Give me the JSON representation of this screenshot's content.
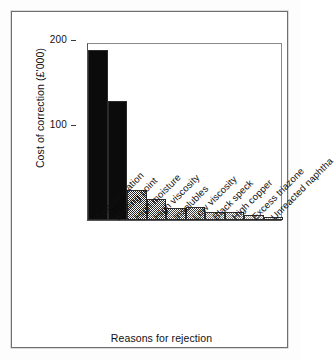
{
  "chart_data": {
    "type": "bar",
    "title": "",
    "xlabel": "Reasons for rejection",
    "ylabel": "Cost of correction (£'000)",
    "ylim": [
      0,
      210
    ],
    "yticks": [
      100,
      200
    ],
    "ytick_labels": [
      "100",
      "200"
    ],
    "grid": false,
    "legend": false,
    "categories": [
      "Contamination",
      "Melting point",
      "High moisture",
      "High viscosity",
      "Insolubles",
      "Low viscosity",
      "Black speck",
      "High copper",
      "Excess triazone",
      "Unreacted naphtha"
    ],
    "values": [
      200,
      141,
      36,
      25,
      14,
      15,
      9,
      9,
      6,
      3
    ],
    "bar_shades": [
      "#0b0b0b",
      "#0b0b0b",
      "#222222",
      "#2c2c2c",
      "#3c3c3c",
      "#3c3c3c",
      "#6e6e6e",
      "#6e6e6e",
      "#9a9a9a",
      "#b4b4b4"
    ],
    "bar_edge_color": "#2b2b2b",
    "axis_color": "#3a3a3a",
    "background_color": "#ffffff"
  }
}
